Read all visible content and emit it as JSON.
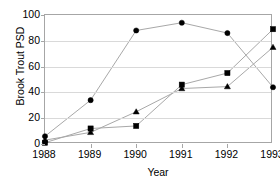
{
  "chart_data": {
    "type": "line",
    "title": "",
    "xlabel": "Year",
    "ylabel": "Brook Trout PSD",
    "categories": [
      "1988",
      "1989",
      "1990",
      "1991",
      "1992",
      "1993"
    ],
    "x": [
      1988,
      1989,
      1990,
      1991,
      1992,
      1993
    ],
    "xlim": [
      1988,
      1993
    ],
    "ylim": [
      0,
      100
    ],
    "y_ticks": [
      0,
      20,
      40,
      60,
      80,
      100
    ],
    "x_ticks": [
      "1988",
      "1989",
      "1990",
      "1991",
      "1992",
      "1993"
    ],
    "grid": true,
    "legend": "none",
    "series": [
      {
        "name": "series-1",
        "marker": "circle",
        "values": [
          6,
          34,
          88,
          94,
          86,
          44
        ]
      },
      {
        "name": "series-2",
        "marker": "square",
        "values": [
          1,
          12,
          14,
          46,
          55,
          89
        ]
      },
      {
        "name": "series-3",
        "marker": "triangle",
        "values": [
          3,
          9,
          25,
          43,
          44.5,
          75
        ]
      }
    ],
    "colors": {
      "line": "#a8a8a8",
      "marker": "#000000",
      "gridline": "#d9d9d9",
      "axis": "#a6a6a6",
      "text": "#000000",
      "background": "#ffffff"
    }
  }
}
